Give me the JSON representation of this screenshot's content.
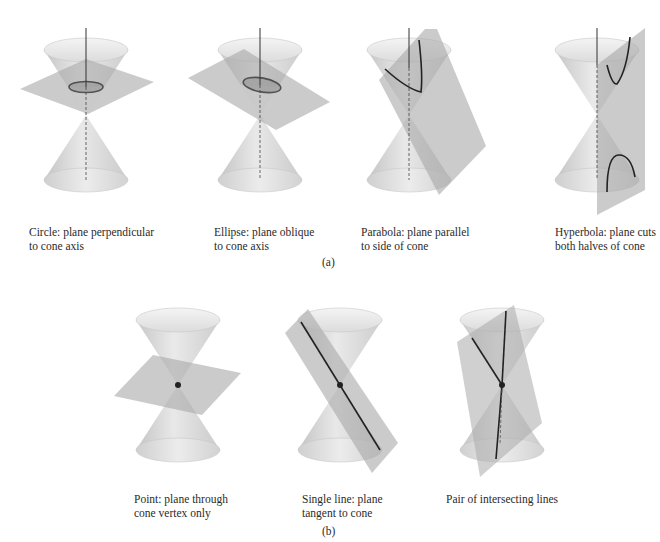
{
  "figure": {
    "part_a": {
      "label": "(a)",
      "panels": [
        {
          "id": "circle",
          "title": "Circle",
          "caption_line1": "Circle: plane perpendicular",
          "caption_line2": "to cone axis"
        },
        {
          "id": "ellipse",
          "title": "Ellipse",
          "caption_line1": "Ellipse: plane oblique",
          "caption_line2": "to cone axis"
        },
        {
          "id": "parabola",
          "title": "Parabola",
          "caption_line1": "Parabola: plane parallel",
          "caption_line2": "to side of cone"
        },
        {
          "id": "hyperbola",
          "title": "Hyperbola",
          "caption_line1": "Hyperbola: plane cuts",
          "caption_line2": "both halves of cone"
        }
      ]
    },
    "part_b": {
      "label": "(b)",
      "panels": [
        {
          "id": "point",
          "title": "Point",
          "caption_line1": "Point: plane through",
          "caption_line2": "cone vertex only"
        },
        {
          "id": "single-line",
          "title": "Single line",
          "caption_line1": "Single line: plane",
          "caption_line2": "tangent to cone"
        },
        {
          "id": "intersecting-lines",
          "title": "Pair of intersecting lines",
          "caption_line1": "Pair of intersecting lines",
          "caption_line2": ""
        }
      ]
    },
    "colors": {
      "cone_fill": "#d6d6d6",
      "cone_rim": "#eeeeee",
      "plane_fill": "#b8b8b8",
      "curve": "#2b2b2b",
      "axis": "#333333"
    }
  }
}
